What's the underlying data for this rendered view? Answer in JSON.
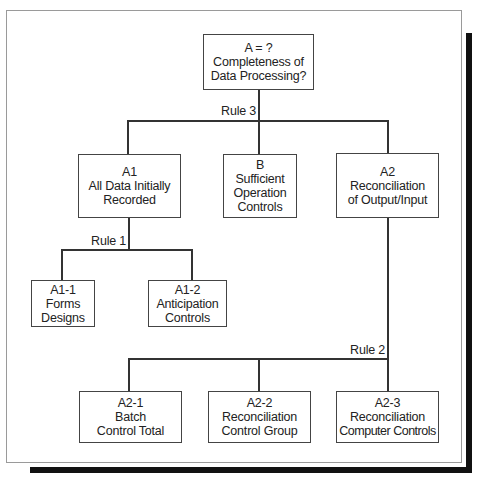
{
  "diagram": {
    "type": "tree",
    "root": {
      "id": "A",
      "lines": [
        "A = ?",
        "Completeness of",
        "Data Processing?"
      ]
    },
    "rules": {
      "rule3": "Rule 3",
      "rule1": "Rule 1",
      "rule2": "Rule 2"
    },
    "level1": [
      {
        "id": "A1",
        "lines": [
          "A1",
          "All Data Initially",
          "Recorded"
        ]
      },
      {
        "id": "B",
        "lines": [
          "B",
          "Sufficient",
          "Operation",
          "Controls"
        ]
      },
      {
        "id": "A2",
        "lines": [
          "A2",
          "Reconciliation",
          "of Output/Input"
        ]
      }
    ],
    "a1_children": [
      {
        "id": "A1-1",
        "lines": [
          "A1-1",
          "Forms",
          "Designs"
        ]
      },
      {
        "id": "A1-2",
        "lines": [
          "A1-2",
          "Anticipation",
          "Controls"
        ]
      }
    ],
    "a2_children": [
      {
        "id": "A2-1",
        "lines": [
          "A2-1",
          "Batch",
          "Control Total"
        ]
      },
      {
        "id": "A2-2",
        "lines": [
          "A2-2",
          "Reconciliation",
          "Control Group"
        ]
      },
      {
        "id": "A2-3",
        "lines": [
          "A2-3",
          "Reconciliation",
          "Computer Controls"
        ]
      }
    ],
    "edges": [
      {
        "from": "A",
        "to": [
          "A1",
          "B",
          "A2"
        ],
        "label": "Rule 3"
      },
      {
        "from": "A1",
        "to": [
          "A1-1",
          "A1-2"
        ],
        "label": "Rule 1"
      },
      {
        "from": "A2",
        "to": [
          "A2-1",
          "A2-2",
          "A2-3"
        ],
        "label": "Rule 2"
      }
    ]
  }
}
